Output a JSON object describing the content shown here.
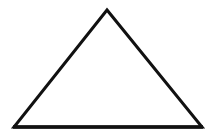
{
  "diagram": {
    "shape": "triangle",
    "type": "isosceles",
    "fill": "#ffffff",
    "stroke": "#111111",
    "stroke_width": 3,
    "vertices": {
      "apex": [
        107,
        10
      ],
      "base_left": [
        14,
        127
      ],
      "base_right": [
        202,
        127
      ]
    },
    "background": "#ffffff"
  }
}
